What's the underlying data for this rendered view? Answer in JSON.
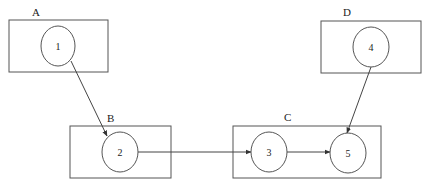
{
  "diagram": {
    "groups": [
      {
        "id": "A",
        "label": "A",
        "x": 9,
        "y": 20,
        "w": 99,
        "h": 52,
        "lx": 32,
        "ly": 16
      },
      {
        "id": "B",
        "label": "B",
        "x": 70,
        "y": 126,
        "w": 101,
        "h": 52,
        "lx": 107,
        "ly": 122
      },
      {
        "id": "C",
        "label": "C",
        "x": 233,
        "y": 126,
        "w": 148,
        "h": 52,
        "lx": 284,
        "ly": 121
      },
      {
        "id": "D",
        "label": "D",
        "x": 321,
        "y": 21,
        "w": 100,
        "h": 52,
        "lx": 343,
        "ly": 16
      }
    ],
    "nodes": [
      {
        "id": "1",
        "label": "1",
        "cx": 58,
        "cy": 46,
        "rx": 17,
        "ry": 20,
        "group": "A"
      },
      {
        "id": "2",
        "label": "2",
        "cx": 120,
        "cy": 152,
        "rx": 18,
        "ry": 20,
        "group": "B"
      },
      {
        "id": "3",
        "label": "3",
        "cx": 269,
        "cy": 152,
        "rx": 18,
        "ry": 20,
        "group": "C"
      },
      {
        "id": "4",
        "label": "4",
        "cx": 371,
        "cy": 47,
        "rx": 18,
        "ry": 20,
        "group": "D"
      },
      {
        "id": "5",
        "label": "5",
        "cx": 348,
        "cy": 153,
        "rx": 18,
        "ry": 20,
        "group": "C"
      }
    ],
    "edges": [
      {
        "from": "1",
        "to": "2",
        "x1": 71,
        "y1": 61,
        "x2": 107,
        "y2": 136
      },
      {
        "from": "2",
        "to": "3",
        "x1": 138,
        "y1": 152,
        "x2": 251,
        "y2": 152
      },
      {
        "from": "3",
        "to": "5",
        "x1": 287,
        "y1": 152,
        "x2": 330,
        "y2": 152
      },
      {
        "from": "4",
        "to": "5",
        "x1": 371,
        "y1": 67,
        "x2": 347,
        "y2": 133
      }
    ]
  }
}
